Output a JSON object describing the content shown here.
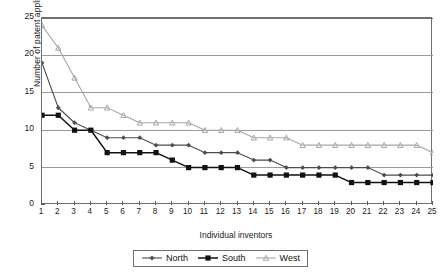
{
  "chart_data": {
    "type": "line",
    "title": "",
    "xlabel": "Individual inventors",
    "ylabel": "Number of patent applications",
    "x": [
      1,
      2,
      3,
      4,
      5,
      6,
      7,
      8,
      9,
      10,
      11,
      12,
      13,
      14,
      15,
      16,
      17,
      18,
      19,
      20,
      21,
      22,
      23,
      24,
      25
    ],
    "xtick_labels": [
      "1",
      "2",
      "3",
      "4",
      "5",
      "6",
      "7",
      "8",
      "9",
      "10",
      "11",
      "12",
      "13",
      "14",
      "15",
      "16",
      "17",
      "18",
      "19",
      "20",
      "21",
      "22",
      "23",
      "24",
      "25"
    ],
    "ytick_labels": [
      "0",
      "5",
      "10",
      "15",
      "20",
      "25"
    ],
    "yticks": [
      0,
      5,
      10,
      15,
      20,
      25
    ],
    "ylim": [
      0,
      25
    ],
    "xlim": [
      1,
      25
    ],
    "grid": "horizontal",
    "legend_position": "bottom-center",
    "series": [
      {
        "name": "North",
        "marker": "diamond",
        "color": "#4d4d4d",
        "values": [
          19,
          13,
          11,
          10,
          9,
          9,
          9,
          8,
          8,
          8,
          7,
          7,
          7,
          6,
          6,
          5,
          5,
          5,
          5,
          5,
          5,
          4,
          4,
          4,
          4
        ]
      },
      {
        "name": "South",
        "marker": "square",
        "color": "#111111",
        "values": [
          12,
          12,
          10,
          10,
          7,
          7,
          7,
          7,
          6,
          5,
          5,
          5,
          5,
          4,
          4,
          4,
          4,
          4,
          4,
          3,
          3,
          3,
          3,
          3,
          3
        ]
      },
      {
        "name": "West",
        "marker": "triangle",
        "color": "#a8a8a8",
        "values": [
          24,
          21,
          17,
          13,
          13,
          12,
          11,
          11,
          11,
          11,
          10,
          10,
          10,
          9,
          9,
          9,
          8,
          8,
          8,
          8,
          8,
          8,
          8,
          8,
          7
        ]
      }
    ]
  },
  "legend": {
    "items": [
      {
        "label": "North"
      },
      {
        "label": "South"
      },
      {
        "label": "West"
      }
    ]
  }
}
